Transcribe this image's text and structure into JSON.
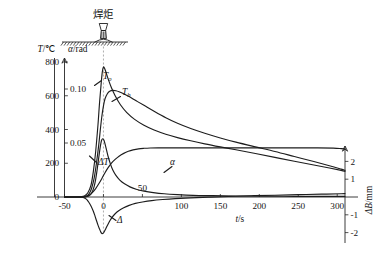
{
  "figure": {
    "annotation_cjk": "焊炬",
    "torch_icon": "welding-torch-icon"
  },
  "chart_data": {
    "type": "line",
    "title": "",
    "subtitle": "",
    "xlabel": "t/s",
    "ylabel_left_primary": "T/℃",
    "ylabel_left_secondary": "α/rad",
    "ylabel_right": "ΔB/mm",
    "grid": false,
    "legend": "inline-curve-labels",
    "xlim": [
      -50,
      310
    ],
    "xticks": [
      -50,
      0,
      50,
      100,
      150,
      200,
      250,
      300
    ],
    "xtick_labels": [
      "-50",
      "0",
      "50",
      "100",
      "150",
      "200",
      "250",
      "300"
    ],
    "ylim_left_primary": [
      0,
      850
    ],
    "yticks_left_primary": [
      0,
      200,
      400,
      600,
      800
    ],
    "ytick_labels_left_primary": [
      "0",
      "200",
      "400",
      "600",
      "800"
    ],
    "ylim_left_secondary": [
      0,
      0.1275
    ],
    "yticks_left_secondary": [
      0.05,
      0.1
    ],
    "ytick_labels_left_secondary": [
      "0.05",
      "0.10"
    ],
    "ylim_right": [
      -2.6,
      2.6
    ],
    "yticks_right": [
      -2,
      -1,
      1,
      2
    ],
    "ytick_labels_right": [
      "-2",
      "-1",
      "1",
      "2"
    ],
    "annotations": [
      {
        "name": "torch-callout",
        "text": "焊炬",
        "x": 0,
        "note": "welding torch above workpiece surface"
      },
      {
        "name": "weld-start-marker",
        "text": "",
        "x": 0,
        "note": "dashed vertical line at t = 0"
      }
    ],
    "series": [
      {
        "name": "T_o",
        "label": "T_o",
        "label_main": "T",
        "label_sub": "o",
        "axis": "left-temperature",
        "units": "℃",
        "peak": {
          "t": 0,
          "value": 770
        },
        "points": [
          [
            -50,
            0
          ],
          [
            -34,
            0
          ],
          [
            -28,
            2
          ],
          [
            -24,
            8
          ],
          [
            -20,
            25
          ],
          [
            -16,
            70
          ],
          [
            -13,
            150
          ],
          [
            -10,
            270
          ],
          [
            -7,
            430
          ],
          [
            -5,
            560
          ],
          [
            -3,
            670
          ],
          [
            -1.5,
            740
          ],
          [
            0,
            770
          ],
          [
            1.5,
            762
          ],
          [
            3,
            742
          ],
          [
            6,
            700
          ],
          [
            10,
            650
          ],
          [
            15,
            600
          ],
          [
            22,
            545
          ],
          [
            30,
            500
          ],
          [
            40,
            460
          ],
          [
            52,
            425
          ],
          [
            65,
            397
          ],
          [
            80,
            372
          ],
          [
            95,
            352
          ],
          [
            112,
            333
          ],
          [
            130,
            315
          ],
          [
            150,
            297
          ],
          [
            170,
            280
          ],
          [
            195,
            258
          ],
          [
            220,
            235
          ],
          [
            245,
            212
          ],
          [
            270,
            190
          ],
          [
            290,
            172
          ],
          [
            305,
            158
          ],
          [
            310,
            152
          ]
        ]
      },
      {
        "name": "T_b",
        "label": "T_b",
        "label_main": "T",
        "label_sub": "b",
        "axis": "left-temperature",
        "units": "℃",
        "peak": {
          "t": 12,
          "value": 632
        },
        "points": [
          [
            -50,
            0
          ],
          [
            -30,
            0
          ],
          [
            -25,
            2
          ],
          [
            -21,
            8
          ],
          [
            -18,
            22
          ],
          [
            -15,
            55
          ],
          [
            -12,
            110
          ],
          [
            -9,
            200
          ],
          [
            -6,
            310
          ],
          [
            -4,
            400
          ],
          [
            -2,
            480
          ],
          [
            0,
            540
          ],
          [
            2,
            582
          ],
          [
            5,
            612
          ],
          [
            8,
            626
          ],
          [
            12,
            632
          ],
          [
            16,
            630
          ],
          [
            20,
            624
          ],
          [
            26,
            612
          ],
          [
            33,
            595
          ],
          [
            42,
            570
          ],
          [
            52,
            543
          ],
          [
            65,
            508
          ],
          [
            80,
            470
          ],
          [
            95,
            437
          ],
          [
            112,
            406
          ],
          [
            130,
            378
          ],
          [
            150,
            350
          ],
          [
            170,
            325
          ],
          [
            195,
            297
          ],
          [
            220,
            270
          ],
          [
            245,
            240
          ],
          [
            270,
            210
          ],
          [
            290,
            185
          ],
          [
            305,
            165
          ],
          [
            310,
            158
          ]
        ]
      },
      {
        "name": "Delta_T",
        "label": "ΔT",
        "axis": "left-temperature",
        "units": "℃",
        "peak": {
          "t": -1,
          "value": 345
        },
        "points": [
          [
            -50,
            0
          ],
          [
            -28,
            0
          ],
          [
            -22,
            2
          ],
          [
            -18,
            8
          ],
          [
            -15,
            25
          ],
          [
            -12,
            62
          ],
          [
            -10,
            105
          ],
          [
            -8,
            165
          ],
          [
            -6,
            235
          ],
          [
            -4,
            300
          ],
          [
            -2.5,
            335
          ],
          [
            -1,
            345
          ],
          [
            0.5,
            338
          ],
          [
            2,
            315
          ],
          [
            4,
            278
          ],
          [
            6,
            240
          ],
          [
            9,
            195
          ],
          [
            12,
            160
          ],
          [
            16,
            128
          ],
          [
            21,
            100
          ],
          [
            27,
            78
          ],
          [
            34,
            60
          ],
          [
            42,
            46
          ],
          [
            52,
            35
          ],
          [
            64,
            26
          ],
          [
            78,
            19
          ],
          [
            95,
            14
          ],
          [
            115,
            10
          ],
          [
            140,
            8
          ],
          [
            170,
            6
          ],
          [
            205,
            5
          ],
          [
            245,
            4
          ],
          [
            285,
            4
          ],
          [
            310,
            4
          ]
        ]
      },
      {
        "name": "alpha",
        "label": "α",
        "axis": "left-angle",
        "units": "rad",
        "plateau": 0.0455,
        "points": [
          [
            -50,
            0
          ],
          [
            -26,
            0
          ],
          [
            -22,
            0.0006
          ],
          [
            -18,
            0.0018
          ],
          [
            -14,
            0.0042
          ],
          [
            -10,
            0.0078
          ],
          [
            -6,
            0.0122
          ],
          [
            -2,
            0.0172
          ],
          [
            2,
            0.0225
          ],
          [
            6,
            0.0272
          ],
          [
            10,
            0.0312
          ],
          [
            15,
            0.0348
          ],
          [
            20,
            0.0378
          ],
          [
            26,
            0.0404
          ],
          [
            32,
            0.0423
          ],
          [
            38,
            0.0436
          ],
          [
            45,
            0.0446
          ],
          [
            52,
            0.0451
          ],
          [
            60,
            0.0454
          ],
          [
            70,
            0.0455
          ],
          [
            85,
            0.0455
          ],
          [
            110,
            0.0455
          ],
          [
            140,
            0.0455
          ],
          [
            175,
            0.0455
          ],
          [
            210,
            0.0455
          ],
          [
            245,
            0.0455
          ],
          [
            275,
            0.0455
          ],
          [
            295,
            0.0452
          ],
          [
            305,
            0.0448
          ],
          [
            310,
            0.0445
          ]
        ]
      },
      {
        "name": "Delta",
        "label": "Δ",
        "axis": "right-deflection",
        "units": "mm",
        "minimum": {
          "t": -2,
          "value": -2.05
        },
        "points": [
          [
            -50,
            0
          ],
          [
            -30,
            0
          ],
          [
            -26,
            -0.03
          ],
          [
            -22,
            -0.12
          ],
          [
            -19,
            -0.28
          ],
          [
            -16,
            -0.5
          ],
          [
            -13,
            -0.8
          ],
          [
            -11,
            -1.05
          ],
          [
            -9,
            -1.32
          ],
          [
            -7,
            -1.58
          ],
          [
            -5,
            -1.8
          ],
          [
            -3.5,
            -1.96
          ],
          [
            -2,
            -2.05
          ],
          [
            -0.5,
            -2.04
          ],
          [
            1,
            -1.95
          ],
          [
            3,
            -1.78
          ],
          [
            5,
            -1.6
          ],
          [
            8,
            -1.35
          ],
          [
            11,
            -1.14
          ],
          [
            15,
            -0.94
          ],
          [
            20,
            -0.76
          ],
          [
            26,
            -0.6
          ],
          [
            33,
            -0.47
          ],
          [
            41,
            -0.36
          ],
          [
            50,
            -0.28
          ],
          [
            62,
            -0.2
          ],
          [
            76,
            -0.14
          ],
          [
            92,
            -0.09
          ],
          [
            112,
            -0.05
          ],
          [
            135,
            -0.01
          ],
          [
            160,
            0.03
          ],
          [
            190,
            0.07
          ],
          [
            220,
            0.1
          ],
          [
            250,
            0.13
          ],
          [
            280,
            0.16
          ],
          [
            305,
            0.18
          ],
          [
            310,
            0.19
          ]
        ]
      }
    ]
  }
}
